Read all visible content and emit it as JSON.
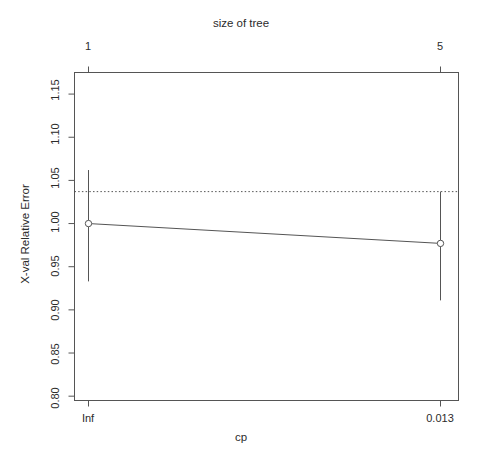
{
  "chart_data": {
    "type": "line",
    "title": "",
    "top_axis_label": "size of tree",
    "xlabel": "cp",
    "ylabel": "X-val Relative Error",
    "x": [
      1,
      2
    ],
    "top_tick_labels": [
      "1",
      "5"
    ],
    "bottom_tick_labels": [
      "Inf",
      "0.013"
    ],
    "values": [
      1.0,
      0.977
    ],
    "yerr_upper": [
      1.062,
      1.037
    ],
    "yerr_lower": [
      0.933,
      0.911
    ],
    "ylim": [
      0.795,
      1.175
    ],
    "y_tick_labels": [
      "0.80",
      "0.85",
      "0.90",
      "0.95",
      "1.00",
      "1.05",
      "1.10",
      "1.15"
    ],
    "y_tick_values": [
      0.8,
      0.85,
      0.9,
      0.95,
      1.0,
      1.05,
      1.1,
      1.15
    ],
    "threshold_line": 1.037,
    "threshold_style": "dotted",
    "grid": false,
    "legend": "none",
    "point_marker": "open-circle",
    "series": [
      {
        "name": "X-val Relative Error",
        "values": [
          1.0,
          0.977
        ]
      }
    ],
    "colors": {
      "line": "#555555",
      "axis": "#555555",
      "text": "#2b2b2b",
      "background": "#ffffff"
    }
  }
}
